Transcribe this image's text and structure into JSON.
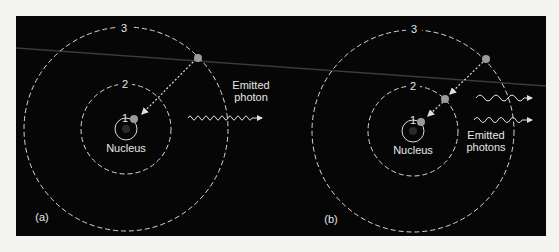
{
  "figure": {
    "panels": [
      {
        "id": "a",
        "label": "(a)",
        "orbit_labels": [
          "1",
          "2",
          "3"
        ],
        "nucleus_label": "Nucleus",
        "photon_label_line1": "Emitted",
        "photon_label_line2": "photon",
        "transition": "3 → 1",
        "photon_count": 1
      },
      {
        "id": "b",
        "label": "(b)",
        "orbit_labels": [
          "1",
          "2",
          "3"
        ],
        "nucleus_label": "Nucleus",
        "photon_label_line1": "Emitted",
        "photon_label_line2": "photons",
        "transition": "3 → 2 → 1",
        "photon_count": 2
      }
    ],
    "colors": {
      "background": "#060606",
      "page": "#f4f4f2",
      "orbit": "#d8d8d8",
      "electron": "#9a9a9a",
      "text": "#e6e6e6"
    }
  }
}
